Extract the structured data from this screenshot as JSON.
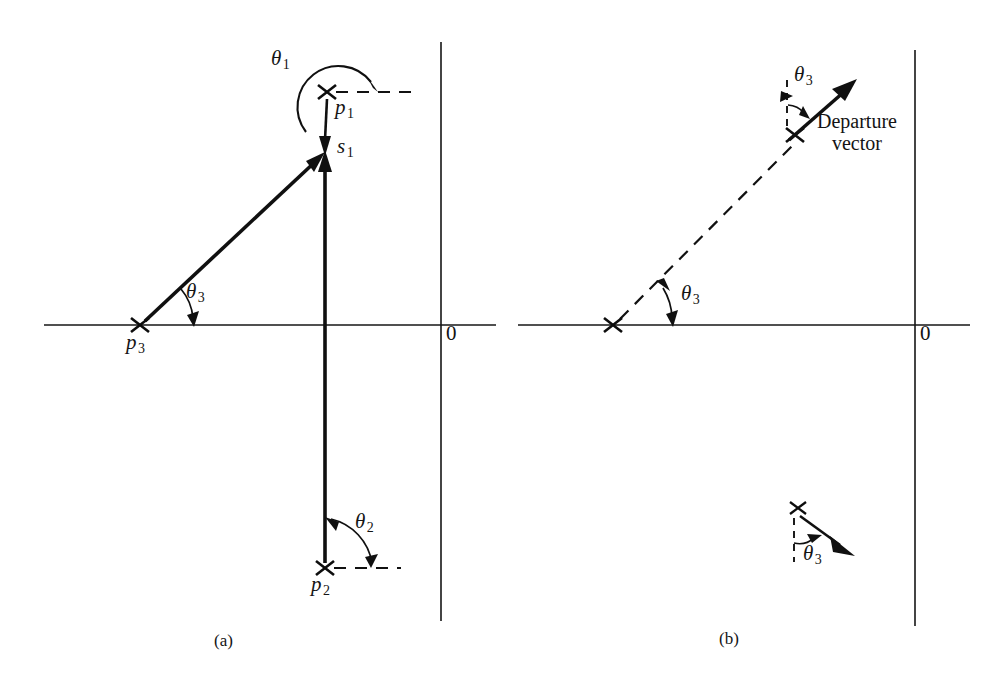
{
  "figure": {
    "background_color": "#ffffff",
    "ink_color": "#101010",
    "panels": [
      {
        "id": "a",
        "caption": "(a)",
        "caption_x": 225,
        "caption_y": 637,
        "axes": {
          "origin_label": "0",
          "origin_label_x": 446,
          "origin_label_y": 329,
          "horizontal": {
            "x1": 44,
            "y1": 325,
            "x2": 496,
            "y2": 325
          },
          "vertical": {
            "x1": 441,
            "y1": 42,
            "x2": 441,
            "y2": 621
          }
        },
        "points": [
          {
            "name": "p1",
            "label": "p",
            "subscript": "1",
            "x": 327,
            "y": 92,
            "label_x": 336,
            "label_y": 98
          },
          {
            "name": "s1",
            "label": "s",
            "subscript": "1",
            "x": 325,
            "y": 158,
            "label_x": 337,
            "label_y": 147
          },
          {
            "name": "p2",
            "label": "p",
            "subscript": "2",
            "x": 325,
            "y": 568,
            "label_x": 313,
            "label_y": 576
          },
          {
            "name": "p3",
            "label": "p",
            "subscript": "3",
            "x": 140,
            "y": 325,
            "label_x": 128,
            "label_y": 333
          }
        ],
        "angles": [
          {
            "name": "theta1",
            "label": "θ",
            "subscript": "1",
            "label_x": 271,
            "label_y": 58,
            "from": "p1",
            "measured_from": "positive-real-axis-dashed",
            "direction": "counterclockwise"
          },
          {
            "name": "theta2",
            "label": "θ",
            "subscript": "2",
            "label_x": 356,
            "label_y": 521,
            "from": "p2",
            "measured_from": "positive-real-axis-dashed",
            "direction": "counterclockwise"
          },
          {
            "name": "theta3",
            "label": "θ",
            "subscript": "3",
            "label_x": 186,
            "label_y": 290,
            "from": "p3",
            "measured_from": "positive-real-axis",
            "direction": "counterclockwise"
          }
        ],
        "dashed_segments": [
          {
            "name": "p1-horizontal-reference",
            "x1": 335,
            "y1": 92,
            "x2": 413,
            "y2": 92
          },
          {
            "name": "p2-horizontal-reference",
            "x1": 333,
            "y1": 568,
            "x2": 400,
            "y2": 568
          }
        ],
        "vectors": [
          {
            "name": "p3-to-s1",
            "from_x": 143,
            "from_y": 322,
            "to_x": 322,
            "to_y": 155,
            "style": "solid-arrow"
          },
          {
            "name": "p2-to-s1",
            "from_x": 325,
            "from_y": 562,
            "to_x": 325,
            "to_y": 156,
            "style": "solid-arrow"
          },
          {
            "name": "p1-to-s1",
            "from_x": 327,
            "from_y": 98,
            "to_x": 325,
            "to_y": 150,
            "style": "solid-arrow"
          }
        ]
      },
      {
        "id": "b",
        "caption": "(b)",
        "caption_x": 730,
        "caption_y": 635,
        "axes": {
          "origin_label": "0",
          "origin_label_x": 920,
          "origin_label_y": 329,
          "horizontal": {
            "x1": 518,
            "y1": 325,
            "x2": 970,
            "y2": 325
          },
          "vertical": {
            "x1": 915,
            "y1": 50,
            "x2": 915,
            "y2": 626
          }
        },
        "points": [
          {
            "name": "pole-lower-left",
            "x": 613,
            "y": 325
          },
          {
            "name": "pole-upper",
            "x": 795,
            "y": 135
          },
          {
            "name": "pole-detail-inset",
            "x": 798,
            "y": 508
          }
        ],
        "angles": [
          {
            "name": "theta3-locus",
            "label": "θ",
            "subscript": "3",
            "label_x": 681,
            "label_y": 292,
            "measured_from": "positive-real-axis",
            "direction": "counterclockwise"
          },
          {
            "name": "theta3-departure",
            "label": "θ",
            "subscript": "3",
            "label_x": 797,
            "label_y": 74,
            "measured_from": "vertical-dashed-reference",
            "direction": "clockwise"
          },
          {
            "name": "theta3-inset",
            "label": "θ",
            "subscript": "3",
            "label_x": 804,
            "label_y": 551,
            "measured_from": "vertical-dashed-reference-downward",
            "direction": "counterclockwise"
          }
        ],
        "dashed_segments": [
          {
            "name": "pole-locus-dashed",
            "x1": 617,
            "y1": 321,
            "x2": 800,
            "y2": 150
          },
          {
            "name": "departure-vertical-reference",
            "x1": 786,
            "y1": 80,
            "x2": 786,
            "y2": 128
          },
          {
            "name": "inset-vertical-reference",
            "x1": 793,
            "y1": 515,
            "x2": 793,
            "y2": 563
          }
        ],
        "vectors": [
          {
            "name": "departure-vector",
            "from_x": 789,
            "from_y": 141,
            "to_x": 855,
            "to_y": 82,
            "style": "solid-arrow"
          },
          {
            "name": "inset-departure-vector",
            "from_x": 800,
            "from_y": 514,
            "to_x": 848,
            "to_y": 550,
            "style": "solid-arrow"
          }
        ],
        "labels": [
          {
            "name": "departure-vector-label",
            "line1": "Departure",
            "line2": "vector",
            "x": 817,
            "y": 118
          }
        ]
      }
    ]
  }
}
